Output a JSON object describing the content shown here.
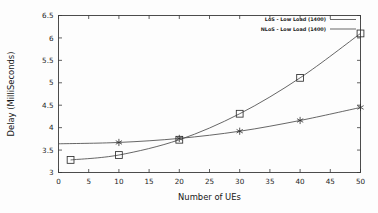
{
  "chart_data": {
    "type": "line",
    "title": "",
    "subtitle": "",
    "xlabel": "Number of UEs",
    "ylabel": "Delay (MilliSeconds)",
    "xlim": [
      0,
      50
    ],
    "ylim": [
      3,
      6.5
    ],
    "xticks": [
      0,
      5,
      10,
      15,
      20,
      25,
      30,
      35,
      40,
      45,
      50
    ],
    "xtick_labels": [
      "0",
      "5",
      "10",
      "15",
      "20",
      "25",
      "30",
      "35",
      "40",
      "45",
      "50"
    ],
    "yticks": [
      3,
      3.5,
      4,
      4.5,
      5,
      5.5,
      6,
      6.5
    ],
    "ytick_labels": [
      "3",
      "3.5",
      "4",
      "4.5",
      "5",
      "5.5",
      "6",
      "6.5"
    ],
    "grid": false,
    "legend_position": "top-right-inside",
    "series": [
      {
        "name": "LoS - Low Load (1400)",
        "marker": "star",
        "color": "#4b4b4b",
        "x": [
          0,
          10,
          20,
          30,
          40,
          50
        ],
        "values": [
          3.64,
          3.67,
          3.76,
          3.92,
          4.16,
          4.45
        ],
        "marker_x": [
          10,
          20,
          30,
          40,
          50
        ],
        "marker_values": [
          3.67,
          3.76,
          3.92,
          4.16,
          4.45
        ]
      },
      {
        "name": "NLoS - Low Load (1400)",
        "marker": "open-square",
        "color": "#4b4b4b",
        "x": [
          2,
          10,
          20,
          30,
          40,
          50
        ],
        "values": [
          3.28,
          3.39,
          3.73,
          4.31,
          5.11,
          6.1
        ],
        "marker_x": [
          2,
          10,
          20,
          30,
          40,
          50
        ],
        "marker_values": [
          3.28,
          3.39,
          3.73,
          4.31,
          5.11,
          6.1
        ]
      }
    ]
  },
  "legend": {
    "entries": [
      {
        "label": "LoS - Low Load (1400)"
      },
      {
        "label": "NLoS - Low Load (1400)"
      }
    ]
  },
  "axes": {
    "x_title": "Number of UEs",
    "y_title": "Delay (MilliSeconds)"
  }
}
